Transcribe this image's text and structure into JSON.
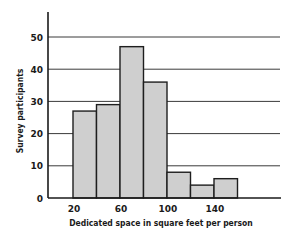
{
  "chart_data": {
    "type": "bar",
    "subtype": "histogram",
    "title": "",
    "xlabel": "Dedicated space in square feet per person",
    "ylabel": "Survey participants",
    "bins": [
      [
        20,
        40
      ],
      [
        40,
        60
      ],
      [
        60,
        80
      ],
      [
        80,
        100
      ],
      [
        100,
        120
      ],
      [
        120,
        140
      ],
      [
        140,
        160
      ]
    ],
    "categories": [
      "20-40",
      "40-60",
      "60-80",
      "80-100",
      "100-120",
      "120-140",
      "140-160"
    ],
    "values": [
      27,
      29,
      47,
      36,
      8,
      4,
      6
    ],
    "xticks": [
      "20",
      "60",
      "100",
      "140"
    ],
    "xtick_values": [
      20,
      60,
      100,
      140
    ],
    "yticks": [
      "0",
      "10",
      "20",
      "30",
      "40",
      "50"
    ],
    "ytick_values": [
      0,
      10,
      20,
      30,
      40,
      50
    ],
    "ylim": [
      0,
      58
    ],
    "xlim": [
      5,
      215
    ],
    "grid": "horizontal",
    "legend": null
  },
  "style": {
    "bar_fill": "#cfcfcf",
    "bar_stroke": "#1e1e1e",
    "grid_color": "#3a3a3a",
    "axis_color": "#1a1a1a"
  }
}
